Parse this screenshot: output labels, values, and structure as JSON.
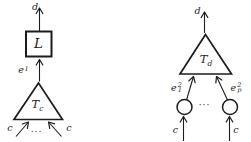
{
  "diagram": {
    "background": "#ffffff",
    "ink_color": "#1c1c1c",
    "left_tree": {
      "output_label": "d",
      "box_label": "L",
      "edge_label": {
        "base": "e",
        "sup": "1"
      },
      "triangle_label": {
        "base": "T",
        "sub": "c"
      },
      "input_left_label": "c",
      "input_right_label": "c",
      "ellipsis": "..."
    },
    "right_tree": {
      "output_label": "d",
      "triangle_label": {
        "base": "T",
        "sub": "d"
      },
      "edge_left_label": {
        "base": "e",
        "sup": "2",
        "sub": "1"
      },
      "edge_right_label": {
        "base": "e",
        "sup": "2",
        "sub": "p"
      },
      "input_left_label": "c",
      "input_right_label": "c",
      "ellipsis": "···"
    }
  }
}
